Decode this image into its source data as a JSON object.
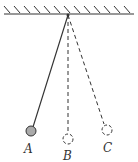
{
  "diagram": {
    "type": "pendulum-positions",
    "ceiling": {
      "hatched": true
    },
    "pivot": {
      "x": 68,
      "y": 14
    },
    "positions": [
      {
        "label": "A",
        "style": "solid",
        "ball_filled": true,
        "ball_color": "#aaaaaa"
      },
      {
        "label": "B",
        "style": "dashed",
        "ball_filled": false
      },
      {
        "label": "C",
        "style": "dashed",
        "ball_filled": false
      }
    ]
  }
}
